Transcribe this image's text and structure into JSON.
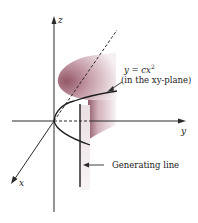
{
  "diagram": {
    "axes": {
      "x_label": "x",
      "y_label": "y",
      "z_label": "z"
    },
    "annotations": {
      "curve_eq": "y = cx",
      "curve_eq_exp": "2",
      "curve_note": "(in the xy-plane)",
      "generating_line": "Generating line"
    },
    "colors": {
      "surface_dark": "#8a4a5a",
      "surface_light": "#f4ecee",
      "line": "#2a2a2a",
      "background": "#ffffff"
    }
  }
}
